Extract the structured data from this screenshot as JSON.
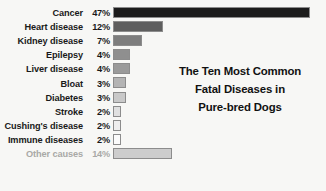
{
  "title": {
    "lines": [
      "The Ten Most Common",
      "Fatal Diseases in",
      "Pure-bred Dogs"
    ]
  },
  "colors": {
    "background": "#f7f7f5",
    "label": "#1a1a1a",
    "muted_label": "#a9a9a6",
    "bar_border": "#8c8c8c",
    "title": "#111111"
  },
  "chart_data": {
    "type": "bar",
    "orientation": "horizontal",
    "xlabel": "",
    "ylabel": "",
    "grid": false,
    "legend": false,
    "value_suffix": "%",
    "xlim": [
      0,
      47
    ],
    "categories": [
      "Cancer",
      "Heart disease",
      "Kidney disease",
      "Epilepsy",
      "Liver disease",
      "Bloat",
      "Diabetes",
      "Stroke",
      "Cushing's disease",
      "Immune diseases",
      "Other causes"
    ],
    "values": [
      47,
      12,
      7,
      4,
      4,
      3,
      3,
      2,
      2,
      2,
      14
    ],
    "value_labels": [
      "47%",
      "12%",
      "7%",
      "4%",
      "4%",
      "3%",
      "3%",
      "2%",
      "2%",
      "2%",
      "14%"
    ],
    "bar_colors": [
      "#1c1c1c",
      "#5e5e5e",
      "#7d7d7d",
      "#8f8f8f",
      "#9a9a9a",
      "#b4b4b4",
      "#c9c9c9",
      "#e0e0e0",
      "#eeeeee",
      "#fbfbfb",
      "#cdcdcd"
    ],
    "muted_rows": [
      10
    ]
  }
}
